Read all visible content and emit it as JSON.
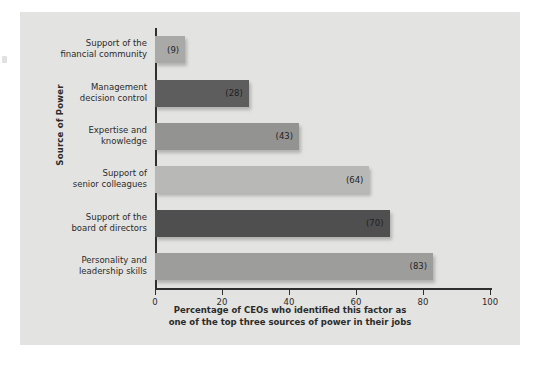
{
  "chart_data": {
    "type": "bar",
    "orientation": "horizontal",
    "title": "",
    "xlabel": "Percentage of CEOs who identified this factor as\none of the top three sources of power in their jobs",
    "ylabel": "Source of Power",
    "xlim": [
      0,
      100
    ],
    "xticks": [
      0,
      20,
      40,
      60,
      80,
      100
    ],
    "xtick_labels": [
      "0",
      "20",
      "40",
      "60",
      "80",
      "100"
    ],
    "grid": false,
    "legend": "none",
    "categories": [
      "Support of the\nfinancial community",
      "Management\ndecision control",
      "Expertise and\nknowledge",
      "Support of\nsenior colleagues",
      "Support of the\nboard of directors",
      "Personality and\nleadership skills"
    ],
    "values": [
      9,
      28,
      43,
      64,
      70,
      83
    ],
    "value_labels": [
      "(9)",
      "(28)",
      "(43)",
      "(64)",
      "(70)",
      "(83)"
    ],
    "bar_colors": [
      "#a9a9a7",
      "#5d5d5d",
      "#939391",
      "#b8b8b6",
      "#4f4f4f",
      "#9d9d9b"
    ]
  },
  "panel": {
    "background_color": "#e3e3e1",
    "axis_color": "#2f2f2f",
    "text_color": "#2b2b2b"
  }
}
